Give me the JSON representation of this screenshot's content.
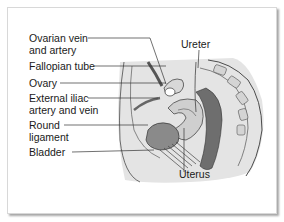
{
  "figure": {
    "labels": {
      "ovarian_vein_line1": "Ovarian vein",
      "ovarian_vein_line2": "and artery",
      "fallopian_tube": "Fallopian tube",
      "ovary": "Ovary",
      "external_iliac_line1": "External iliac",
      "external_iliac_line2": "artery and vein",
      "round_ligament_line1": "Round",
      "round_ligament_line2": "ligament",
      "bladder": "Bladder",
      "ureter": "Ureter",
      "uterus": "Uterus"
    },
    "colors": {
      "background_region": "#e6e6e6",
      "dark_tissue": "#7a7a7a",
      "mid_tissue": "#b5b5b5",
      "outline": "#3a3a3a",
      "leader_line": "#333333"
    }
  }
}
